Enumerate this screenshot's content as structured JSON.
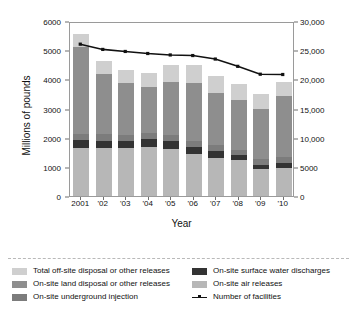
{
  "chart_data": {
    "type": "bar",
    "title": "",
    "xlabel": "Year",
    "ylabel": "Millions of pounds",
    "ylabel_right": "Number of facilities",
    "categories": [
      "2001",
      "'02",
      "'03",
      "'04",
      "'05",
      "'06",
      "'07",
      "'08",
      "'09",
      "'10"
    ],
    "ylim": [
      0,
      6000
    ],
    "ylim_right": [
      0,
      30000
    ],
    "yticks": [
      "0",
      "1000",
      "2000",
      "3000",
      "4000",
      "5000",
      "6000"
    ],
    "ytick_values": [
      0,
      1000,
      2000,
      3000,
      4000,
      5000,
      6000
    ],
    "yticks_right": [
      "0",
      "5000",
      "10,000",
      "15,000",
      "20,000",
      "25,000",
      "30,000"
    ],
    "ytick_values_right": [
      0,
      5000,
      10000,
      15000,
      20000,
      25000,
      30000
    ],
    "grid": false,
    "legend_position": "below",
    "stacked": true,
    "series": [
      {
        "name": "On-site air releases",
        "key": "air",
        "color": "#b7b7b7",
        "values": [
          1650,
          1650,
          1640,
          1680,
          1620,
          1430,
          1300,
          1230,
          940,
          950
        ]
      },
      {
        "name": "On-site surface water discharges",
        "key": "water",
        "color": "#333333",
        "values": [
          260,
          250,
          250,
          260,
          250,
          240,
          260,
          160,
          130,
          190
        ]
      },
      {
        "name": "On-site underground injection",
        "key": "injection",
        "color": "#7c7c7c",
        "values": [
          200,
          210,
          200,
          210,
          210,
          210,
          200,
          200,
          190,
          200
        ]
      },
      {
        "name": "On-site land disposal or other releases",
        "key": "land",
        "color": "#8e8e8e",
        "values": [
          3000,
          2080,
          1770,
          1600,
          1820,
          2010,
          1780,
          1700,
          1740,
          2080
        ]
      },
      {
        "name": "Total off-site disposal or other releases",
        "key": "offsite",
        "color": "#cfcfcf",
        "values": [
          440,
          450,
          470,
          470,
          590,
          600,
          560,
          560,
          490,
          490
        ]
      }
    ],
    "line_series": {
      "name": "Number of facilities",
      "color": "#111111",
      "axis": "right",
      "values": [
        26200,
        25300,
        24950,
        24600,
        24350,
        24250,
        23650,
        22400,
        21050,
        21000
      ]
    }
  },
  "legend": {
    "left_column": [
      {
        "label": "Total off-site disposal or other releases",
        "color": "#cfcfcf",
        "type": "swatch",
        "name": "legend-offsite"
      },
      {
        "label": "On-site land disposal or other releases",
        "color": "#8e8e8e",
        "type": "swatch",
        "name": "legend-land"
      },
      {
        "label": "On-site underground injection",
        "color": "#7c7c7c",
        "type": "swatch",
        "name": "legend-injection"
      }
    ],
    "right_column": [
      {
        "label": "On-site surface water discharges",
        "color": "#333333",
        "type": "swatch",
        "name": "legend-water"
      },
      {
        "label": "On-site air releases",
        "color": "#b7b7b7",
        "type": "swatch",
        "name": "legend-air"
      },
      {
        "label": "Number of facilities",
        "color": "#111111",
        "type": "line",
        "name": "legend-facilities"
      }
    ]
  }
}
